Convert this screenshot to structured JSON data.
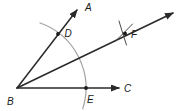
{
  "diagram": {
    "kind": "angle-bisector-construction",
    "labels": {
      "A": "A",
      "B": "B",
      "C": "C",
      "D": "D",
      "E": "E",
      "F": "F"
    },
    "colors": {
      "ray": "#2a2a2a",
      "construction_arc": "#a3a3a3",
      "text": "#1a1a1a",
      "background": "#ffffff"
    }
  }
}
